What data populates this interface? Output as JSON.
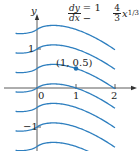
{
  "figure": {
    "equation": {
      "lhs_num": "dy",
      "lhs_den": "dx",
      "eq_sign": "= 1 −",
      "coef_num": "4",
      "coef_den": "3",
      "term": "x",
      "exponent": "1/3"
    },
    "axis_labels": {
      "y": "y"
    },
    "x_ticks": [
      "0",
      "1",
      "2"
    ],
    "y_ticks": [
      "1",
      "−1"
    ],
    "point_label": "(1, 0.5)",
    "colors": {
      "curve": "#2e7fbf",
      "axis": "#333333",
      "point": "#1f6fb0"
    }
  },
  "chart_data": {
    "type": "line",
    "xlabel": "",
    "ylabel": "y",
    "x_ticks": [
      0,
      1,
      2
    ],
    "y_ticks": [
      -1,
      1
    ],
    "xlim": [
      -0.55,
      2
    ],
    "series": [
      {
        "name": "C=1.5",
        "C": 1.5
      },
      {
        "name": "C=1",
        "C": 1
      },
      {
        "name": "C=0.5",
        "C": 0.5
      },
      {
        "name": "C=0",
        "C": 0
      },
      {
        "name": "C=-0.5",
        "C": -0.5
      },
      {
        "name": "C=-1",
        "C": -1
      },
      {
        "name": "C=-1.5",
        "C": -1.5
      }
    ],
    "highlighted_point": {
      "x": 1,
      "y": 0.5,
      "label": "(1, 0.5)"
    },
    "grid": false
  }
}
